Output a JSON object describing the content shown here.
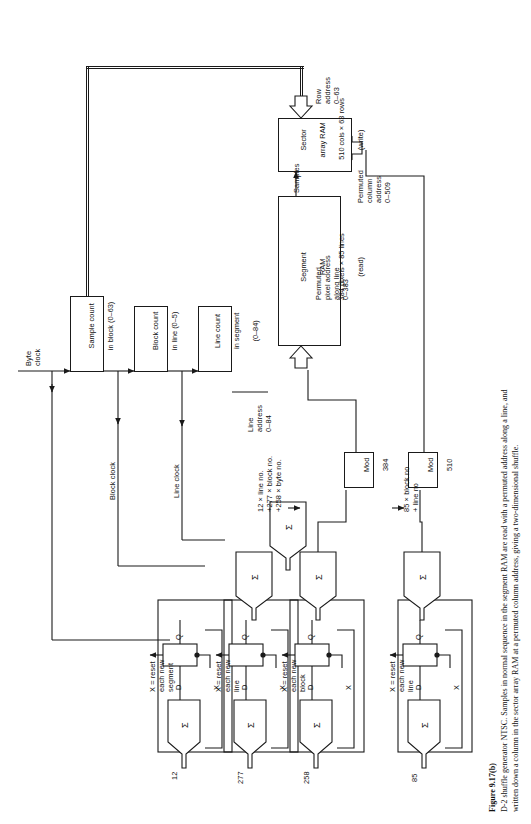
{
  "figure": {
    "number": "Figure 9.17(b)",
    "caption": "D-2 shuffle generator NTSC. Samples in normal sequence in the segment RAM are read with a permuted address along a line, and written down a column in the sector array RAM at a permuted column address, giving a two-dimensional shuffle."
  },
  "inputs": {
    "byte_clock": "Byte\nclock",
    "block_clock": "Block clock",
    "line_clock": "Line clock"
  },
  "counters": [
    {
      "id": "sample-count",
      "line1": "Sample count",
      "line2": "in block (0–63)"
    },
    {
      "id": "block-count",
      "line1": "Block count",
      "line2": "in line (0–5)"
    },
    {
      "id": "line-count",
      "line1": "Line count",
      "line2": "in segment",
      "line3": "(0–84)"
    }
  ],
  "rams": [
    {
      "id": "segment-ram",
      "line1": "Segment",
      "line2": "RAM",
      "line3": "384 pixels × 85 lines",
      "line4": "(read)"
    },
    {
      "id": "sector-array-ram",
      "line1": "Sector",
      "line2": "array RAM",
      "line3": "510 cols × 63 rows",
      "line4": "(write)"
    }
  ],
  "mods": [
    {
      "id": "mod-384",
      "line1": "Mod",
      "line2": "384"
    },
    {
      "id": "mod-510",
      "line1": "Mod",
      "line2": "510"
    }
  ],
  "accumulators": [
    {
      "id": "acc-12",
      "constant": "12",
      "reset": "X = reset\neach new\nsegment"
    },
    {
      "id": "acc-277",
      "constant": "277",
      "reset": "X = reset\neach new\nline"
    },
    {
      "id": "acc-258",
      "constant": "258",
      "reset": "X = reset\neach new\nblock"
    },
    {
      "id": "acc-85",
      "constant": "85",
      "reset": "X = reset\neach new\nline"
    }
  ],
  "ff_pins": {
    "d": "D",
    "q": "Q",
    "x": "X",
    "sigma": "Σ"
  },
  "signals": {
    "row_address": "Row\naddress\n0–63",
    "permuted_column_address": "Permuted\ncolumn\naddress\n0–509",
    "samples": "Samples",
    "permuted_pixel_address": "Permuted\npixel address\nalong line\n0–383",
    "line_address": "Line\naddress\n0–84",
    "sum_expression": "12 × line no.\n+277 × block no.\n+258 × byte no.",
    "block_line_expression": "85 × block no\n+ line no"
  },
  "colors": {
    "ink": "#1a1a1a",
    "paper": "#ffffff"
  }
}
